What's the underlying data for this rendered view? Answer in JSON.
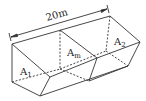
{
  "diagram": {
    "length_label": "20m",
    "sections": [
      {
        "id": "A1",
        "main": "A",
        "sub": "1"
      },
      {
        "id": "Am",
        "main": "A",
        "sub": "m"
      },
      {
        "id": "A2",
        "main": "A",
        "sub": "2"
      }
    ],
    "colors": {
      "line": "#333333",
      "background": "#ffffff"
    }
  }
}
